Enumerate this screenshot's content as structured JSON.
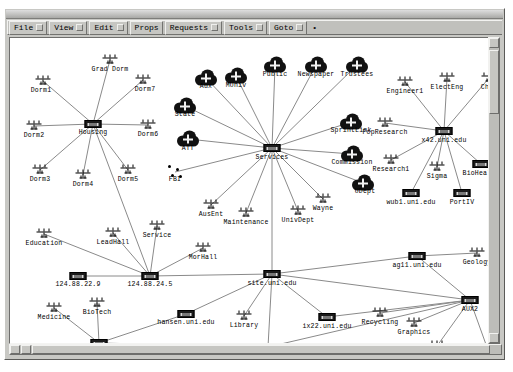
{
  "window": {
    "title": ""
  },
  "menubar": {
    "items": [
      {
        "label": "File",
        "has_cue": true
      },
      {
        "label": "View",
        "has_cue": true
      },
      {
        "label": "Edit",
        "has_cue": true
      },
      {
        "label": "Props",
        "has_cue": false
      },
      {
        "label": "Requests",
        "has_cue": true
      },
      {
        "label": "Tools",
        "has_cue": true
      },
      {
        "label": "Goto",
        "has_cue": true
      }
    ],
    "trailing_mark": "•"
  },
  "scrollbars": {
    "vertical": {
      "up_arrow": "▲",
      "down_arrow": "▼"
    },
    "horizontal": {
      "left_arrow": "◀",
      "right_arrow": "▶"
    }
  },
  "graph": {
    "title": "Network topology map",
    "nodes": [
      {
        "id": "grad_dorm",
        "label": "Grad Dorm",
        "type": "segment",
        "x": 100,
        "y": 22,
        "lx": 0,
        "ly": 11
      },
      {
        "id": "dorm1",
        "label": "Dorm1",
        "type": "segment",
        "x": 33,
        "y": 43,
        "lx": -2,
        "ly": 11
      },
      {
        "id": "dorm7",
        "label": "Dorm7",
        "type": "segment",
        "x": 133,
        "y": 42,
        "lx": 2,
        "ly": 11
      },
      {
        "id": "dorm2",
        "label": "Dorm2",
        "type": "segment",
        "x": 24,
        "y": 88,
        "lx": 0,
        "ly": 11
      },
      {
        "id": "housing",
        "label": "Housing",
        "type": "hub",
        "x": 83,
        "y": 86,
        "lx": 0,
        "ly": 9
      },
      {
        "id": "dorm6",
        "label": "Dorm6",
        "type": "segment",
        "x": 138,
        "y": 87,
        "lx": 0,
        "ly": 11
      },
      {
        "id": "dorm3",
        "label": "Dorm3",
        "type": "segment",
        "x": 30,
        "y": 132,
        "lx": 0,
        "ly": 11
      },
      {
        "id": "dorm4",
        "label": "Dorm4",
        "type": "segment",
        "x": 73,
        "y": 137,
        "lx": 0,
        "ly": 11
      },
      {
        "id": "dorm5",
        "label": "Dorm5",
        "type": "segment",
        "x": 118,
        "y": 132,
        "lx": 0,
        "ly": 11
      },
      {
        "id": "aux",
        "label": "Aux",
        "type": "cloud",
        "x": 196,
        "y": 40,
        "lx": 0,
        "ly": 13
      },
      {
        "id": "muniv",
        "label": "MUniv",
        "type": "cloud",
        "x": 226,
        "y": 38,
        "lx": 0,
        "ly": 14
      },
      {
        "id": "public",
        "label": "Public",
        "type": "cloud",
        "x": 265,
        "y": 27,
        "lx": 0,
        "ly": 14
      },
      {
        "id": "newspaper",
        "label": "Newspaper",
        "type": "cloud",
        "x": 306,
        "y": 27,
        "lx": 0,
        "ly": 14
      },
      {
        "id": "trustees",
        "label": "Trustees",
        "type": "cloud",
        "x": 347,
        "y": 27,
        "lx": 0,
        "ly": 14
      },
      {
        "id": "state",
        "label": "State",
        "type": "cloud",
        "x": 175,
        "y": 68,
        "lx": 0,
        "ly": 13
      },
      {
        "id": "att",
        "label": "ATT",
        "type": "cloud",
        "x": 178,
        "y": 101,
        "lx": 0,
        "ly": 14
      },
      {
        "id": "fbi",
        "label": "FBI",
        "type": "dots",
        "x": 165,
        "y": 134,
        "lx": 0,
        "ly": 11
      },
      {
        "id": "services",
        "label": "Services",
        "type": "hub",
        "x": 262,
        "y": 110,
        "lx": 0,
        "ly": 10
      },
      {
        "id": "ausent",
        "label": "AusEnt",
        "type": "segment",
        "x": 201,
        "y": 167,
        "lx": 0,
        "ly": 11
      },
      {
        "id": "maintenance",
        "label": "Maintenance",
        "type": "segment",
        "x": 236,
        "y": 175,
        "lx": 0,
        "ly": 11
      },
      {
        "id": "univdept",
        "label": "UnivDept",
        "type": "segment",
        "x": 288,
        "y": 173,
        "lx": 0,
        "ly": 11
      },
      {
        "id": "wayne",
        "label": "Wayne",
        "type": "segment",
        "x": 313,
        "y": 161,
        "lx": 0,
        "ly": 11
      },
      {
        "id": "udept",
        "label": "UDept",
        "type": "cloud",
        "x": 353,
        "y": 145,
        "lx": 2,
        "ly": 13
      },
      {
        "id": "commission",
        "label": "Commission",
        "type": "cloud",
        "x": 342,
        "y": 116,
        "lx": 0,
        "ly": 13
      },
      {
        "id": "sprintlink",
        "label": "SprintLink",
        "type": "cloud",
        "x": 341,
        "y": 84,
        "lx": 0,
        "ly": 13
      },
      {
        "id": "engineer1",
        "label": "Engineer1",
        "type": "segment",
        "x": 395,
        "y": 44,
        "lx": 0,
        "ly": 11
      },
      {
        "id": "electeng",
        "label": "ElectEng",
        "type": "segment",
        "x": 437,
        "y": 40,
        "lx": 0,
        "ly": 11
      },
      {
        "id": "chem",
        "label": "Chem",
        "type": "segment",
        "x": 479,
        "y": 40,
        "lx": 0,
        "ly": 11
      },
      {
        "id": "popresearch",
        "label": "PopResearch",
        "type": "segment",
        "x": 375,
        "y": 85,
        "lx": 0,
        "ly": 11
      },
      {
        "id": "x42",
        "label": "x42.uni.edu",
        "type": "hub",
        "x": 434,
        "y": 93,
        "lx": 0,
        "ly": 10
      },
      {
        "id": "research1",
        "label": "Research1",
        "type": "segment",
        "x": 381,
        "y": 122,
        "lx": 0,
        "ly": 11
      },
      {
        "id": "sigma",
        "label": "Sigma",
        "type": "segment",
        "x": 427,
        "y": 129,
        "lx": 0,
        "ly": 11
      },
      {
        "id": "biohealth",
        "label": "BioHealth",
        "type": "hub",
        "x": 471,
        "y": 126,
        "lx": 0,
        "ly": 10
      },
      {
        "id": "wub1",
        "label": "wub1.uni.edu",
        "type": "hub",
        "x": 401,
        "y": 155,
        "lx": 0,
        "ly": 10
      },
      {
        "id": "portiv",
        "label": "PortIV",
        "type": "hub",
        "x": 452,
        "y": 155,
        "lx": 0,
        "ly": 10
      },
      {
        "id": "education",
        "label": "Education",
        "type": "segment",
        "x": 34,
        "y": 196,
        "lx": 0,
        "ly": 11
      },
      {
        "id": "leadhall",
        "label": "LeadHall",
        "type": "segment",
        "x": 103,
        "y": 195,
        "lx": 0,
        "ly": 11
      },
      {
        "id": "service",
        "label": "Service",
        "type": "segment",
        "x": 147,
        "y": 188,
        "lx": 0,
        "ly": 11
      },
      {
        "id": "ip22",
        "label": "124.88.22.9",
        "type": "hub",
        "x": 68,
        "y": 238,
        "lx": 0,
        "ly": 9
      },
      {
        "id": "ip24",
        "label": "124.88.24.5",
        "type": "hub",
        "x": 140,
        "y": 238,
        "lx": 0,
        "ly": 9
      },
      {
        "id": "morhall",
        "label": "MorHall",
        "type": "segment",
        "x": 193,
        "y": 210,
        "lx": 0,
        "ly": 11
      },
      {
        "id": "site",
        "label": "site.uni.edu",
        "type": "hub",
        "x": 262,
        "y": 236,
        "lx": 0,
        "ly": 10
      },
      {
        "id": "agl1",
        "label": "ag11.uni.edu",
        "type": "hub",
        "x": 407,
        "y": 218,
        "lx": 0,
        "ly": 10
      },
      {
        "id": "geology",
        "label": "Geology",
        "type": "segment",
        "x": 467,
        "y": 215,
        "lx": 0,
        "ly": 11
      },
      {
        "id": "medicine",
        "label": "Medicine",
        "type": "segment",
        "x": 44,
        "y": 270,
        "lx": 0,
        "ly": 11
      },
      {
        "id": "biotech",
        "label": "BioTech",
        "type": "segment",
        "x": 87,
        "y": 265,
        "lx": 0,
        "ly": 11
      },
      {
        "id": "researchhall",
        "label": "ResearchHall",
        "type": "segment",
        "x": 27,
        "y": 314,
        "lx": 4,
        "ly": 11
      },
      {
        "id": "broker",
        "label": "Broker",
        "type": "hub",
        "x": 89,
        "y": 305,
        "lx": 0,
        "ly": 9
      },
      {
        "id": "biosci",
        "label": "Bio Sci",
        "type": "segment",
        "x": 131,
        "y": 322,
        "lx": 0,
        "ly": 11
      },
      {
        "id": "hansen",
        "label": "hansen.uni.edu",
        "type": "hub",
        "x": 176,
        "y": 276,
        "lx": 0,
        "ly": 9
      },
      {
        "id": "library",
        "label": "Library",
        "type": "segment",
        "x": 234,
        "y": 278,
        "lx": 0,
        "ly": 11
      },
      {
        "id": "anthro",
        "label": "Anthro",
        "type": "segment",
        "x": 208,
        "y": 312,
        "lx": 0,
        "ly": 11
      },
      {
        "id": "sub2",
        "label": "Sub2",
        "type": "hub",
        "x": 258,
        "y": 309,
        "lx": 0,
        "ly": 10
      },
      {
        "id": "ix22",
        "label": "ix22.uni.edu",
        "type": "hub",
        "x": 317,
        "y": 279,
        "lx": 0,
        "ly": 10
      },
      {
        "id": "recycling",
        "label": "Recycling",
        "type": "segment",
        "x": 370,
        "y": 275,
        "lx": 0,
        "ly": 11
      },
      {
        "id": "graphics",
        "label": "Graphics",
        "type": "segment",
        "x": 404,
        "y": 285,
        "lx": 0,
        "ly": 11
      },
      {
        "id": "aux2",
        "label": "AUX2",
        "type": "hub",
        "x": 460,
        "y": 262,
        "lx": 0,
        "ly": 10
      },
      {
        "id": "stuhealth",
        "label": "StuHealth",
        "type": "segment",
        "x": 427,
        "y": 308,
        "lx": 0,
        "ly": 11
      },
      {
        "id": "family",
        "label": "Family",
        "type": "segment",
        "x": 478,
        "y": 312,
        "lx": 0,
        "ly": 11
      },
      {
        "id": "alumni",
        "label": "Alumni",
        "type": "segment",
        "x": 361,
        "y": 326,
        "lx": 0,
        "ly": 11
      }
    ],
    "edges": [
      [
        "housing",
        "grad_dorm"
      ],
      [
        "housing",
        "dorm1"
      ],
      [
        "housing",
        "dorm7"
      ],
      [
        "housing",
        "dorm2"
      ],
      [
        "housing",
        "dorm6"
      ],
      [
        "housing",
        "dorm3"
      ],
      [
        "housing",
        "dorm4"
      ],
      [
        "housing",
        "dorm5"
      ],
      [
        "housing",
        "ip24"
      ],
      [
        "services",
        "aux"
      ],
      [
        "services",
        "muniv"
      ],
      [
        "services",
        "public"
      ],
      [
        "services",
        "newspaper"
      ],
      [
        "services",
        "trustees"
      ],
      [
        "services",
        "state"
      ],
      [
        "services",
        "att"
      ],
      [
        "services",
        "fbi"
      ],
      [
        "services",
        "ausent"
      ],
      [
        "services",
        "maintenance"
      ],
      [
        "services",
        "univdept"
      ],
      [
        "services",
        "wayne"
      ],
      [
        "services",
        "udept"
      ],
      [
        "services",
        "commission"
      ],
      [
        "services",
        "sprintlink"
      ],
      [
        "services",
        "site"
      ],
      [
        "x42",
        "engineer1"
      ],
      [
        "x42",
        "electeng"
      ],
      [
        "x42",
        "chem"
      ],
      [
        "x42",
        "popresearch"
      ],
      [
        "x42",
        "research1"
      ],
      [
        "x42",
        "sigma"
      ],
      [
        "x42",
        "biohealth"
      ],
      [
        "x42",
        "wub1"
      ],
      [
        "x42",
        "portiv"
      ],
      [
        "ip24",
        "education"
      ],
      [
        "ip24",
        "leadhall"
      ],
      [
        "ip24",
        "service"
      ],
      [
        "ip24",
        "ip22"
      ],
      [
        "ip24",
        "morhall"
      ],
      [
        "ip24",
        "site"
      ],
      [
        "site",
        "hansen"
      ],
      [
        "site",
        "library"
      ],
      [
        "site",
        "sub2"
      ],
      [
        "site",
        "ix22"
      ],
      [
        "site",
        "agl1"
      ],
      [
        "site",
        "aux2"
      ],
      [
        "agl1",
        "geology"
      ],
      [
        "agl1",
        "aux2"
      ],
      [
        "broker",
        "medicine"
      ],
      [
        "broker",
        "biotech"
      ],
      [
        "broker",
        "researchhall"
      ],
      [
        "broker",
        "biosci"
      ],
      [
        "broker",
        "hansen"
      ],
      [
        "broker",
        "sub2"
      ],
      [
        "sub2",
        "anthro"
      ],
      [
        "sub2",
        "alumni"
      ],
      [
        "sub2",
        "aux2"
      ],
      [
        "aux2",
        "recycling"
      ],
      [
        "aux2",
        "graphics"
      ],
      [
        "aux2",
        "stuhealth"
      ],
      [
        "aux2",
        "family"
      ],
      [
        "aux2",
        "ix22"
      ]
    ]
  }
}
